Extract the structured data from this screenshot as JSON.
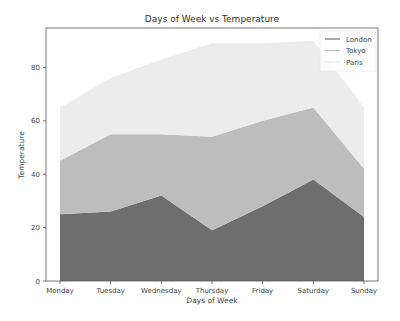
{
  "chart_data": {
    "type": "area",
    "stacked": true,
    "title": "Days of Week vs Temperature",
    "xlabel": "Days of Week",
    "ylabel": "Temperature",
    "categories": [
      "Monday",
      "Tuesday",
      "Wednesday",
      "Thursday",
      "Friday",
      "Saturday",
      "Sunday"
    ],
    "series": [
      {
        "name": "London",
        "values": [
          25,
          26,
          32,
          19,
          28,
          38,
          24
        ],
        "color": "#6e6e6e"
      },
      {
        "name": "Tokyo",
        "values": [
          20,
          29,
          23,
          35,
          32,
          27,
          18
        ],
        "color": "#bdbdbd"
      },
      {
        "name": "Paris",
        "values": [
          20,
          21,
          28,
          35,
          29,
          25,
          23
        ],
        "color": "#ececec"
      }
    ],
    "yticks": [
      0,
      20,
      40,
      60,
      80
    ],
    "ylim": [
      0,
      95
    ],
    "grid": false,
    "legend_position": "upper right"
  }
}
